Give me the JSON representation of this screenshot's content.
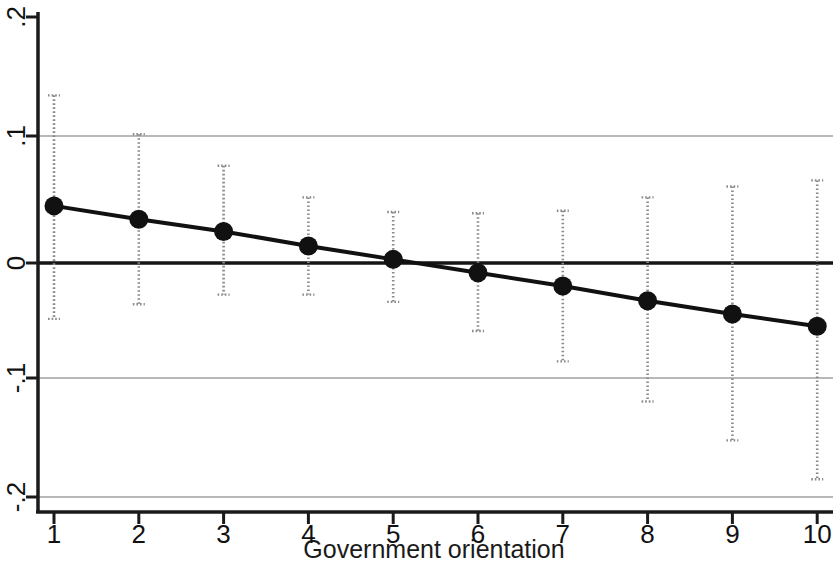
{
  "chart_data": {
    "type": "line",
    "title": "",
    "subtitle": "",
    "xlabel": "Government orientation",
    "ylabel": "",
    "xlim": [
      0.6,
      10.45
    ],
    "ylim": [
      -0.215,
      0.205
    ],
    "xticks": [
      1,
      2,
      3,
      4,
      5,
      6,
      7,
      8,
      9,
      10
    ],
    "xticklabels": [
      "1",
      "2",
      "3",
      "4",
      "5",
      "6",
      "7",
      "8",
      "9",
      "10"
    ],
    "yticks": [
      0.2,
      0.1,
      0,
      -0.1,
      -0.2
    ],
    "yticklabels": [
      ".2",
      ".1",
      "0",
      "-.1",
      "-.2"
    ],
    "grid": "horizontal-at-yticks",
    "legend": "none",
    "zero_line": 0,
    "x": [
      1,
      2,
      3,
      4,
      5,
      6,
      7,
      8,
      9,
      10
    ],
    "series": [
      {
        "name": "Marginal effect",
        "values": [
          0.047,
          0.036,
          0.026,
          0.014,
          0.003,
          -0.008,
          -0.019,
          -0.031,
          -0.042,
          -0.052
        ],
        "ci_lower": [
          -0.046,
          -0.034,
          -0.026,
          -0.026,
          -0.032,
          -0.056,
          -0.081,
          -0.114,
          -0.146,
          -0.178
        ],
        "ci_upper": [
          0.138,
          0.106,
          0.08,
          0.054,
          0.042,
          0.041,
          0.043,
          0.054,
          0.063,
          0.068
        ],
        "marker": "filled-circle",
        "line_color": "#111111",
        "ci_style": "dotted"
      }
    ],
    "annotations": []
  },
  "axes": {
    "x_axis_title": "Government orientation",
    "x_tick_labels": [
      "1",
      "2",
      "3",
      "4",
      "5",
      "6",
      "7",
      "8",
      "9",
      "10"
    ],
    "y_tick_labels": [
      ".2",
      ".1",
      "0",
      "-.1",
      "-.2"
    ]
  },
  "colors": {
    "background": "#ffffff",
    "axis": "#111111",
    "gridline": "#b4b4b4",
    "zero_line": "#111111",
    "series_line": "#111111",
    "marker": "#111111",
    "ci_bar": "#8a8a8a"
  }
}
